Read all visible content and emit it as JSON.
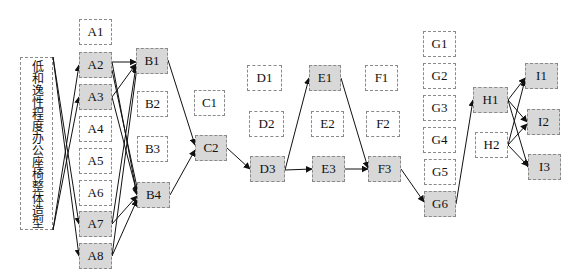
{
  "diagram": {
    "title_label": "低和逸性程度办公座椅整体造型",
    "colors": {
      "selected_fill": "#d8d8d8",
      "normal_fill": "#ffffff",
      "border": "#8a8a8a",
      "edge": "#111111"
    },
    "nodes": [
      {
        "id": "A1",
        "label": "A1",
        "x": 79,
        "y": 19,
        "w": 33,
        "h": 26,
        "selected": false
      },
      {
        "id": "A2",
        "label": "A2",
        "x": 79,
        "y": 52,
        "w": 33,
        "h": 26,
        "selected": true
      },
      {
        "id": "A3",
        "label": "A3",
        "x": 79,
        "y": 84,
        "w": 33,
        "h": 26,
        "selected": true
      },
      {
        "id": "A4",
        "label": "A4",
        "x": 79,
        "y": 116,
        "w": 33,
        "h": 26,
        "selected": false
      },
      {
        "id": "A5",
        "label": "A5",
        "x": 79,
        "y": 148,
        "w": 33,
        "h": 26,
        "selected": false
      },
      {
        "id": "A6",
        "label": "A6",
        "x": 79,
        "y": 180,
        "w": 33,
        "h": 26,
        "selected": false
      },
      {
        "id": "A7",
        "label": "A7",
        "x": 79,
        "y": 211,
        "w": 33,
        "h": 26,
        "selected": true
      },
      {
        "id": "A8",
        "label": "A8",
        "x": 79,
        "y": 243,
        "w": 33,
        "h": 26,
        "selected": true
      },
      {
        "id": "B1",
        "label": "B1",
        "x": 136,
        "y": 48,
        "w": 32,
        "h": 26,
        "selected": true
      },
      {
        "id": "B2",
        "label": "B2",
        "x": 137,
        "y": 91,
        "w": 31,
        "h": 26,
        "selected": false
      },
      {
        "id": "B3",
        "label": "B3",
        "x": 137,
        "y": 136,
        "w": 31,
        "h": 26,
        "selected": false
      },
      {
        "id": "B4",
        "label": "B4",
        "x": 137,
        "y": 182,
        "w": 33,
        "h": 26,
        "selected": true
      },
      {
        "id": "C1",
        "label": "C1",
        "x": 194,
        "y": 90,
        "w": 31,
        "h": 26,
        "selected": false
      },
      {
        "id": "C2",
        "label": "C2",
        "x": 195,
        "y": 135,
        "w": 32,
        "h": 26,
        "selected": true
      },
      {
        "id": "D1",
        "label": "D1",
        "x": 247,
        "y": 65,
        "w": 35,
        "h": 26,
        "selected": false
      },
      {
        "id": "D2",
        "label": "D2",
        "x": 249,
        "y": 111,
        "w": 35,
        "h": 26,
        "selected": false
      },
      {
        "id": "D3",
        "label": "D3",
        "x": 250,
        "y": 156,
        "w": 35,
        "h": 26,
        "selected": true
      },
      {
        "id": "E1",
        "label": "E1",
        "x": 309,
        "y": 65,
        "w": 32,
        "h": 26,
        "selected": true
      },
      {
        "id": "E2",
        "label": "E2",
        "x": 311,
        "y": 111,
        "w": 33,
        "h": 26,
        "selected": false
      },
      {
        "id": "E3",
        "label": "E3",
        "x": 312,
        "y": 156,
        "w": 33,
        "h": 26,
        "selected": true
      },
      {
        "id": "F1",
        "label": "F1",
        "x": 365,
        "y": 65,
        "w": 33,
        "h": 26,
        "selected": false
      },
      {
        "id": "F2",
        "label": "F2",
        "x": 366,
        "y": 111,
        "w": 34,
        "h": 26,
        "selected": false
      },
      {
        "id": "F3",
        "label": "F3",
        "x": 368,
        "y": 156,
        "w": 33,
        "h": 26,
        "selected": true
      },
      {
        "id": "G1",
        "label": "G1",
        "x": 423,
        "y": 31,
        "w": 33,
        "h": 26,
        "selected": false
      },
      {
        "id": "G2",
        "label": "G2",
        "x": 423,
        "y": 63,
        "w": 33,
        "h": 26,
        "selected": false
      },
      {
        "id": "G3",
        "label": "G3",
        "x": 423,
        "y": 95,
        "w": 33,
        "h": 26,
        "selected": false
      },
      {
        "id": "G4",
        "label": "G4",
        "x": 423,
        "y": 127,
        "w": 33,
        "h": 26,
        "selected": false
      },
      {
        "id": "G5",
        "label": "G5",
        "x": 424,
        "y": 159,
        "w": 32,
        "h": 26,
        "selected": false
      },
      {
        "id": "G6",
        "label": "G6",
        "x": 424,
        "y": 191,
        "w": 32,
        "h": 26,
        "selected": true
      },
      {
        "id": "H1",
        "label": "H1",
        "x": 473,
        "y": 87,
        "w": 35,
        "h": 26,
        "selected": true
      },
      {
        "id": "H2",
        "label": "H2",
        "x": 475,
        "y": 132,
        "w": 33,
        "h": 26,
        "selected": false
      },
      {
        "id": "I1",
        "label": "I1",
        "x": 525,
        "y": 63,
        "w": 33,
        "h": 26,
        "selected": true
      },
      {
        "id": "I2",
        "label": "I2",
        "x": 527,
        "y": 109,
        "w": 33,
        "h": 26,
        "selected": true
      },
      {
        "id": "I3",
        "label": "I3",
        "x": 528,
        "y": 154,
        "w": 33,
        "h": 26,
        "selected": true
      }
    ],
    "edges": [
      {
        "from": [
          53,
          230
        ],
        "to": [
          79,
          65
        ]
      },
      {
        "from": [
          53,
          230
        ],
        "to": [
          79,
          97
        ]
      },
      {
        "from": [
          53,
          57
        ],
        "to": [
          79,
          224
        ]
      },
      {
        "from": [
          53,
          57
        ],
        "to": [
          79,
          256
        ]
      },
      {
        "from": [
          112,
          62
        ],
        "to": [
          136,
          62
        ]
      },
      {
        "from": [
          112,
          62
        ],
        "to": [
          137,
          195
        ]
      },
      {
        "from": [
          112,
          70
        ],
        "to": [
          138,
          192
        ]
      },
      {
        "from": [
          112,
          97
        ],
        "to": [
          136,
          64
        ]
      },
      {
        "from": [
          112,
          97
        ],
        "to": [
          137,
          193
        ]
      },
      {
        "from": [
          112,
          224
        ],
        "to": [
          136,
          66
        ]
      },
      {
        "from": [
          112,
          224
        ],
        "to": [
          137,
          196
        ]
      },
      {
        "from": [
          112,
          256
        ],
        "to": [
          137,
          67
        ]
      },
      {
        "from": [
          112,
          256
        ],
        "to": [
          137,
          200
        ]
      },
      {
        "from": [
          168,
          60
        ],
        "to": [
          195,
          145
        ]
      },
      {
        "from": [
          170,
          195
        ],
        "to": [
          195,
          150
        ]
      },
      {
        "from": [
          227,
          148
        ],
        "to": [
          250,
          169
        ]
      },
      {
        "from": [
          285,
          170
        ],
        "to": [
          309,
          78
        ]
      },
      {
        "from": [
          285,
          170
        ],
        "to": [
          312,
          169
        ]
      },
      {
        "from": [
          341,
          78
        ],
        "to": [
          368,
          168
        ]
      },
      {
        "from": [
          345,
          169
        ],
        "to": [
          368,
          169
        ]
      },
      {
        "from": [
          401,
          169
        ],
        "to": [
          424,
          202
        ]
      },
      {
        "from": [
          456,
          204
        ],
        "to": [
          473,
          100
        ]
      },
      {
        "from": [
          508,
          100
        ],
        "to": [
          525,
          78
        ]
      },
      {
        "from": [
          508,
          100
        ],
        "to": [
          527,
          122
        ]
      },
      {
        "from": [
          508,
          100
        ],
        "to": [
          528,
          167
        ]
      },
      {
        "from": [
          508,
          145
        ],
        "to": [
          525,
          80
        ]
      },
      {
        "from": [
          508,
          145
        ],
        "to": [
          527,
          124
        ]
      },
      {
        "from": [
          508,
          145
        ],
        "to": [
          528,
          166
        ]
      }
    ]
  }
}
